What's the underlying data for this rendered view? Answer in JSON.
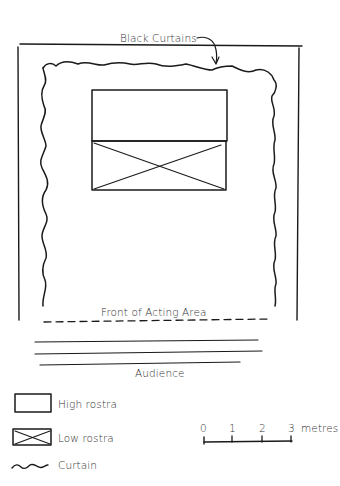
{
  "diagram": {
    "type": "stage-plan",
    "labels": {
      "black_curtains": "Black Curtains",
      "front_of_acting_area": "Front of Acting Area",
      "audience": "Audience"
    },
    "elements": {
      "outer_wall": {
        "x": 19,
        "y": 45,
        "width": 280,
        "height": 275
      },
      "high_rostra": {
        "x": 92,
        "y": 90,
        "width": 135,
        "height": 51
      },
      "low_rostra": {
        "x": 92,
        "y": 141,
        "width": 134,
        "height": 49
      }
    }
  },
  "legend": {
    "items": [
      {
        "symbol": "rectangle",
        "label": "High rostra"
      },
      {
        "symbol": "crossed-rectangle",
        "label": "Low rostra"
      },
      {
        "symbol": "wavy-line",
        "label": "Curtain"
      }
    ]
  },
  "scale": {
    "ticks": [
      "0",
      "1",
      "2",
      "3"
    ],
    "unit": "metres"
  }
}
